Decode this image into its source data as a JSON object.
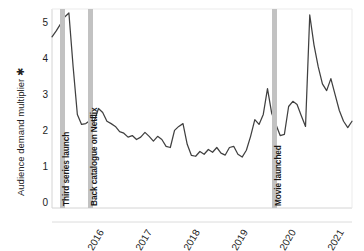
{
  "chart_data": {
    "type": "line",
    "title": "",
    "subtitle": "",
    "xlabel": "",
    "ylabel": "Audience demand multiplier ✱",
    "ylim": [
      0,
      5
    ],
    "xlim": [
      "2015-06",
      "2021-06"
    ],
    "yticks": [
      "0",
      "1",
      "2",
      "3",
      "4",
      "5"
    ],
    "ytick_values": [
      0,
      1,
      2,
      3,
      4,
      5
    ],
    "xticks": [
      "2016",
      "2017",
      "2018",
      "2019",
      "2020",
      "2021"
    ],
    "grid": false,
    "legend": "none",
    "line_color": "#404040",
    "band_color": "#c2c2c2",
    "series": [
      {
        "name": "Audience demand multiplier",
        "x": [
          "2015-06",
          "2015-07",
          "2015-08",
          "2015-09",
          "2015-10",
          "2015-11",
          "2015-12",
          "2016-01",
          "2016-02",
          "2016-03",
          "2016-04",
          "2016-05",
          "2016-06",
          "2016-07",
          "2016-08",
          "2016-09",
          "2016-10",
          "2016-11",
          "2016-12",
          "2017-01",
          "2017-02",
          "2017-03",
          "2017-04",
          "2017-05",
          "2017-06",
          "2017-07",
          "2017-08",
          "2017-09",
          "2017-10",
          "2017-11",
          "2017-12",
          "2018-01",
          "2018-02",
          "2018-03",
          "2018-04",
          "2018-05",
          "2018-06",
          "2018-07",
          "2018-08",
          "2018-09",
          "2018-10",
          "2018-11",
          "2018-12",
          "2019-01",
          "2019-02",
          "2019-03",
          "2019-04",
          "2019-05",
          "2019-06",
          "2019-07",
          "2019-08",
          "2019-09",
          "2019-10",
          "2019-11",
          "2019-12",
          "2020-01",
          "2020-02",
          "2020-03",
          "2020-04",
          "2020-05",
          "2020-06",
          "2020-07",
          "2020-08",
          "2020-09",
          "2020-10",
          "2020-11",
          "2020-12",
          "2021-01",
          "2021-02",
          "2021-03",
          "2021-04",
          "2021-05"
        ],
        "values": [
          4.3,
          4.45,
          4.62,
          4.8,
          4.9,
          3.55,
          2.35,
          2.1,
          2.12,
          2.2,
          2.18,
          2.5,
          2.4,
          2.18,
          2.12,
          2.05,
          1.92,
          1.88,
          1.78,
          1.82,
          1.72,
          1.78,
          1.9,
          1.8,
          1.68,
          1.8,
          1.72,
          1.55,
          1.52,
          1.95,
          2.05,
          2.12,
          1.6,
          1.32,
          1.3,
          1.42,
          1.35,
          1.47,
          1.4,
          1.52,
          1.38,
          1.33,
          1.52,
          1.55,
          1.35,
          1.28,
          1.45,
          1.8,
          2.22,
          2.1,
          2.35,
          3.0,
          2.38,
          2.1,
          1.82,
          1.85,
          2.55,
          2.68,
          2.6,
          2.32,
          2.05,
          4.85,
          4.1,
          3.55,
          3.12,
          2.95,
          3.25,
          2.85,
          2.45,
          2.18,
          2.02,
          2.18
        ]
      }
    ],
    "annotations": [
      {
        "label": "Third series launch",
        "x": "2015-10",
        "type": "vertical-band"
      },
      {
        "label": "Back catalogue on Netflix",
        "x": "2016-03",
        "type": "vertical-band"
      },
      {
        "label": "Movie launched",
        "x": "2020-06",
        "type": "vertical-band"
      }
    ]
  }
}
